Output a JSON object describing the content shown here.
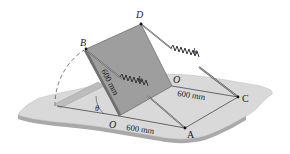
{
  "figure": {
    "points": {
      "B": "B",
      "D": "D",
      "O_top": "O",
      "O_bottom": "O",
      "A": "A",
      "C": "C"
    },
    "dimensions": {
      "plate_edge": "600 mm",
      "ground_OA": "600 mm",
      "ground_OC": "600 mm"
    },
    "springs": {
      "spring_BA": "k",
      "spring_DC": "k"
    },
    "angle": "θ",
    "colors": {
      "plate": "#9c9c9c",
      "plate_edge": "#6e6e6e",
      "ground": "#d8d8d8",
      "ground_edge": "#b4b4b4",
      "lines": "#333333"
    }
  }
}
